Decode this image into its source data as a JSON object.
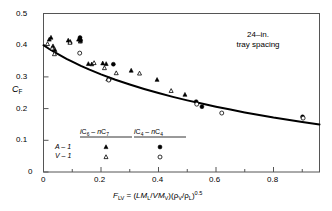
{
  "chart_data": {
    "type": "scatter",
    "title": "",
    "xlabel": "F_LV = (LM_L/VM_V)(rho_V/rho_L)^0.5",
    "ylabel": "C_F",
    "xlim": [
      0,
      0.96
    ],
    "ylim": [
      0,
      0.5
    ],
    "xticks": [
      0,
      0.2,
      0.4,
      0.6,
      0.8
    ],
    "xticklabels": [
      "0",
      "0.2",
      "0.4",
      "0.6",
      "0.8"
    ],
    "xminorticks": [
      0.1,
      0.3,
      0.5,
      0.7,
      0.9
    ],
    "yticks": [
      0,
      0.1,
      0.2,
      0.3,
      0.4,
      0.5
    ],
    "yticklabels": [
      "0",
      "0.1",
      "0.2",
      "0.3",
      "0.4",
      "0.5"
    ],
    "grid": false,
    "legend_position": "lower-left-inside",
    "annotations": [
      {
        "text_line1": "24–in.",
        "text_line2": "tray spacing",
        "x": 0.62,
        "y": 0.455
      }
    ],
    "series": [
      {
        "name": "iC6-nC7 A-1",
        "marker": "filled-triangle",
        "color": "#000000",
        "points": [
          {
            "x": 0.02,
            "y": 0.418
          },
          {
            "x": 0.026,
            "y": 0.424
          },
          {
            "x": 0.033,
            "y": 0.397
          },
          {
            "x": 0.04,
            "y": 0.385
          },
          {
            "x": 0.086,
            "y": 0.415
          },
          {
            "x": 0.093,
            "y": 0.411
          },
          {
            "x": 0.122,
            "y": 0.418
          },
          {
            "x": 0.128,
            "y": 0.421
          },
          {
            "x": 0.156,
            "y": 0.341
          },
          {
            "x": 0.168,
            "y": 0.34
          },
          {
            "x": 0.206,
            "y": 0.343
          },
          {
            "x": 0.218,
            "y": 0.341
          },
          {
            "x": 0.305,
            "y": 0.32
          },
          {
            "x": 0.395,
            "y": 0.291
          },
          {
            "x": 0.492,
            "y": 0.244
          }
        ]
      },
      {
        "name": "iC6-nC7 V-1",
        "marker": "open-triangle",
        "color": "#000000",
        "points": [
          {
            "x": 0.014,
            "y": 0.404
          },
          {
            "x": 0.03,
            "y": 0.39
          },
          {
            "x": 0.038,
            "y": 0.372
          },
          {
            "x": 0.092,
            "y": 0.408
          },
          {
            "x": 0.128,
            "y": 0.412
          },
          {
            "x": 0.176,
            "y": 0.344
          },
          {
            "x": 0.212,
            "y": 0.328
          },
          {
            "x": 0.224,
            "y": 0.293
          },
          {
            "x": 0.253,
            "y": 0.312
          },
          {
            "x": 0.334,
            "y": 0.311
          },
          {
            "x": 0.444,
            "y": 0.256
          }
        ]
      },
      {
        "name": "iC4-nC4 A-1",
        "marker": "filled-circle",
        "color": "#000000",
        "points": [
          {
            "x": 0.127,
            "y": 0.424
          },
          {
            "x": 0.129,
            "y": 0.414
          },
          {
            "x": 0.243,
            "y": 0.34
          },
          {
            "x": 0.229,
            "y": 0.293
          },
          {
            "x": 0.531,
            "y": 0.222
          },
          {
            "x": 0.551,
            "y": 0.206
          },
          {
            "x": 0.901,
            "y": 0.174
          }
        ]
      },
      {
        "name": "iC4-nC4 V-1",
        "marker": "open-circle",
        "color": "#000000",
        "points": [
          {
            "x": 0.126,
            "y": 0.375
          },
          {
            "x": 0.227,
            "y": 0.29
          },
          {
            "x": 0.533,
            "y": 0.214
          },
          {
            "x": 0.62,
            "y": 0.186
          },
          {
            "x": 0.903,
            "y": 0.17
          }
        ]
      }
    ],
    "curve": {
      "name": "design-curve",
      "color": "#000000",
      "linewidth": 2,
      "points": [
        {
          "x": 0.0,
          "y": 0.4
        },
        {
          "x": 0.02,
          "y": 0.388
        },
        {
          "x": 0.04,
          "y": 0.377
        },
        {
          "x": 0.06,
          "y": 0.367
        },
        {
          "x": 0.08,
          "y": 0.357
        },
        {
          "x": 0.1,
          "y": 0.348
        },
        {
          "x": 0.13,
          "y": 0.335
        },
        {
          "x": 0.16,
          "y": 0.323
        },
        {
          "x": 0.2,
          "y": 0.308
        },
        {
          "x": 0.25,
          "y": 0.291
        },
        {
          "x": 0.3,
          "y": 0.276
        },
        {
          "x": 0.35,
          "y": 0.262
        },
        {
          "x": 0.4,
          "y": 0.249
        },
        {
          "x": 0.45,
          "y": 0.237
        },
        {
          "x": 0.5,
          "y": 0.226
        },
        {
          "x": 0.55,
          "y": 0.216
        },
        {
          "x": 0.6,
          "y": 0.206
        },
        {
          "x": 0.65,
          "y": 0.197
        },
        {
          "x": 0.7,
          "y": 0.188
        },
        {
          "x": 0.75,
          "y": 0.18
        },
        {
          "x": 0.8,
          "y": 0.172
        },
        {
          "x": 0.85,
          "y": 0.165
        },
        {
          "x": 0.9,
          "y": 0.158
        },
        {
          "x": 0.96,
          "y": 0.15
        }
      ]
    }
  },
  "axis": {
    "ylabel_main": "C",
    "ylabel_sub": "F",
    "xlabel_parts": {
      "f": "F",
      "f_sub": "LV",
      "eq": " = (",
      "lm": "LM",
      "lm_sub": "L",
      "slash": "/",
      "vm": "VM",
      "vm_sub": "V",
      "close1": ")(",
      "rhov": "ρ",
      "rhov_sub": "V",
      "slash2": "/",
      "rhol": "ρ",
      "rhol_sub": "L",
      "close2": ")",
      "exp": "0.5"
    }
  },
  "annotation": {
    "line1": "24–in.",
    "line2": "tray spacing"
  },
  "legend": {
    "col1": {
      "h_i": "i",
      "h_c1": "C",
      "h_sub1": "6",
      "h_dash": " – ",
      "h_n": "n",
      "h_c2": "C",
      "h_sub2": "7"
    },
    "col2": {
      "h_i": "i",
      "h_c1": "C",
      "h_sub1": "4",
      "h_dash": " – ",
      "h_n": "n",
      "h_c2": "C",
      "h_sub2": "4"
    },
    "row1_label": "A – 1",
    "row2_label": "V – 1"
  },
  "ticks": {
    "y": [
      "0.5",
      "0.4",
      "0.3",
      "0.2",
      "0.1",
      "0"
    ],
    "x": [
      "0",
      "0.2",
      "0.4",
      "0.6",
      "0.8"
    ]
  },
  "colors": {
    "ink": "#000000",
    "frame": "#555555",
    "background": "#ffffff"
  }
}
